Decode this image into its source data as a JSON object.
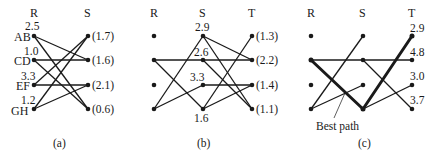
{
  "panel_a": {
    "caption": "(a)",
    "col_r": "R",
    "col_s": "S",
    "r_nodes": [
      {
        "name": "AB",
        "value": "2.5"
      },
      {
        "name": "CD",
        "value": "1.0"
      },
      {
        "name": "EF",
        "value": "3.3"
      },
      {
        "name": "GH",
        "value": "1.2"
      }
    ],
    "s_nodes": [
      "(1.7)",
      "(1.6)",
      "(2.1)",
      "(0.6)"
    ]
  },
  "panel_b": {
    "caption": "(b)",
    "col_r": "R",
    "col_s": "S",
    "col_t": "T",
    "s_values": [
      "2.9",
      "2.6",
      "3.3",
      "1.6"
    ],
    "t_nodes": [
      "(1.3)",
      "(2.2)",
      "(1.4)",
      "(1.1)"
    ]
  },
  "panel_c": {
    "caption": "(c)",
    "col_r": "R",
    "col_s": "S",
    "col_t": "T",
    "t_values": [
      "2.9",
      "4.8",
      "3.0",
      "3.7"
    ],
    "annotation": "Best path"
  }
}
